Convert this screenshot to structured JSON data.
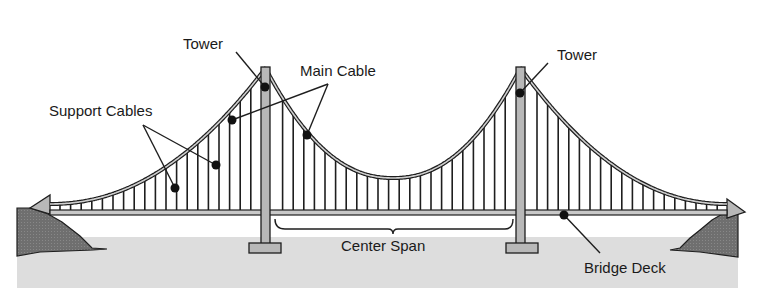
{
  "diagram": {
    "type": "suspension-bridge-diagram",
    "labels": {
      "tower_left": "Tower",
      "tower_right": "Tower",
      "main_cable": "Main Cable",
      "support_cables": "Support Cables",
      "center_span": "Center Span",
      "bridge_deck": "Bridge Deck"
    },
    "colors": {
      "water": "#dcdcdc",
      "land": "#777777",
      "tower_fill": "#b8b8b8",
      "outline": "#1e1e1e",
      "background": "#ffffff"
    }
  }
}
